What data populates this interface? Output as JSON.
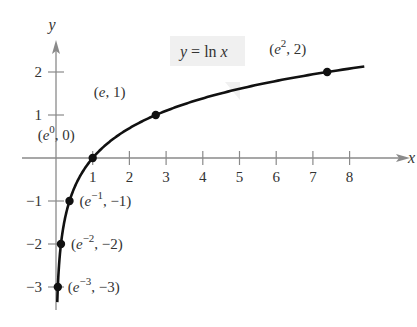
{
  "chart_data": {
    "type": "line",
    "title": "",
    "function_label": "y = ln x",
    "xlabel": "x",
    "ylabel": "y",
    "xlim": [
      -0.5,
      8.9
    ],
    "ylim": [
      -3.4,
      2.7
    ],
    "grid": false,
    "x_ticks": [
      1,
      2,
      3,
      4,
      5,
      6,
      7,
      8
    ],
    "y_ticks": [
      -3,
      -2,
      -1,
      1,
      2
    ],
    "x_tick_labels": [
      "1",
      "2",
      "3",
      "4",
      "5",
      "6",
      "7",
      "8"
    ],
    "y_tick_labels": [
      "−3",
      "−2",
      "−1",
      "1",
      "2"
    ],
    "series": [
      {
        "name": "y = ln x",
        "x_range": [
          0.035,
          8.4
        ],
        "color": "#111111"
      }
    ],
    "points": [
      {
        "label_base": "(e",
        "label_sup": "−3",
        "label_tail": ", −3)",
        "x": 0.0498,
        "y": -3
      },
      {
        "label_base": "(e",
        "label_sup": "−2",
        "label_tail": ", −2)",
        "x": 0.1353,
        "y": -2
      },
      {
        "label_base": "(e",
        "label_sup": "−1",
        "label_tail": ", −1)",
        "x": 0.3679,
        "y": -1
      },
      {
        "label_base": "(e",
        "label_sup": "0",
        "label_tail": ", 0)",
        "x": 1,
        "y": 0
      },
      {
        "label_base": "(e, 1)",
        "label_sup": "",
        "label_tail": "",
        "x": 2.7183,
        "y": 1
      },
      {
        "label_base": "(e",
        "label_sup": "2",
        "label_tail": ", 2)",
        "x": 7.3891,
        "y": 2
      }
    ],
    "colors": {
      "axis": "#8a8a8a",
      "curve": "#111111",
      "label_box": "#f0f0f0",
      "text": "#333333"
    }
  }
}
